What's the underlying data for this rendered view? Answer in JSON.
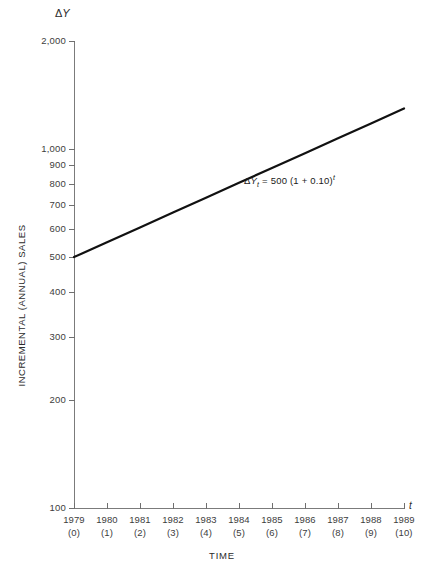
{
  "chart_data": {
    "type": "line",
    "title": "",
    "xlabel": "TIME",
    "ylabel": "INCREMENTAL (ANNUAL) SALES",
    "y_axis_symbol_delta": "Δ",
    "y_axis_symbol_var": "Y",
    "x_axis_symbol": "t",
    "yscale": "log",
    "ylim": [
      100,
      2000
    ],
    "xlim": [
      0,
      10
    ],
    "grid": false,
    "legend": null,
    "y_ticks": [
      {
        "value": 100,
        "label": "100"
      },
      {
        "value": 200,
        "label": "200"
      },
      {
        "value": 300,
        "label": "300"
      },
      {
        "value": 400,
        "label": "400"
      },
      {
        "value": 500,
        "label": "500"
      },
      {
        "value": 600,
        "label": "600"
      },
      {
        "value": 700,
        "label": "700"
      },
      {
        "value": 800,
        "label": "800"
      },
      {
        "value": 900,
        "label": "900"
      },
      {
        "value": 1000,
        "label": "1,000"
      },
      {
        "value": 2000,
        "label": "2,000"
      }
    ],
    "x_ticks": [
      {
        "t": 0,
        "year": "1979",
        "period": "(0)"
      },
      {
        "t": 1,
        "year": "1980",
        "period": "(1)"
      },
      {
        "t": 2,
        "year": "1981",
        "period": "(2)"
      },
      {
        "t": 3,
        "year": "1982",
        "period": "(3)"
      },
      {
        "t": 4,
        "year": "1983",
        "period": "(4)"
      },
      {
        "t": 5,
        "year": "1984",
        "period": "(5)"
      },
      {
        "t": 6,
        "year": "1985",
        "period": "(6)"
      },
      {
        "t": 7,
        "year": "1986",
        "period": "(7)"
      },
      {
        "t": 8,
        "year": "1987",
        "period": "(8)"
      },
      {
        "t": 9,
        "year": "1988",
        "period": "(9)"
      },
      {
        "t": 10,
        "year": "1989",
        "period": "(10)"
      }
    ],
    "x": [
      0,
      1,
      2,
      3,
      4,
      5,
      6,
      7,
      8,
      9,
      10
    ],
    "values": [
      500,
      550,
      605,
      666,
      732,
      805,
      886,
      974,
      1072,
      1179,
      1297
    ],
    "series": [
      {
        "name": "Incremental annual sales",
        "values": [
          500,
          550,
          605,
          666,
          732,
          805,
          886,
          974,
          1072,
          1179,
          1297
        ],
        "color": "#111111",
        "linewidth": 2.2
      }
    ],
    "annotations": [
      {
        "name": "growth-equation",
        "delta": "Δ",
        "var": "Y",
        "subscript": "t",
        "body": " = 500 (1 + 0.10)",
        "superscript": "t",
        "x_pixel": 244,
        "y_pixel": 174
      }
    ],
    "axis_color": "#7b7b7b",
    "text_color": "#2b2b2b",
    "line_color": "#111111",
    "background": "#ffffff"
  }
}
